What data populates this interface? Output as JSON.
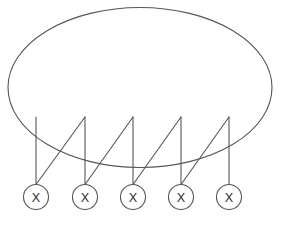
{
  "diagram": {
    "type": "bipartite-plate-graph",
    "stroke_color": "#555555",
    "label_color": "#444444",
    "plate": {
      "shape": "ellipse",
      "cx": 140,
      "cy": 87.5,
      "rx": 132,
      "ry": 80
    },
    "stem_top_y": 117,
    "nodes": [
      {
        "label": "X",
        "cx": 36,
        "cy": 197,
        "r": 12.5
      },
      {
        "label": "X",
        "cx": 85,
        "cy": 197,
        "r": 12.5
      },
      {
        "label": "X",
        "cx": 133,
        "cy": 197,
        "r": 12.5
      },
      {
        "label": "X",
        "cx": 181,
        "cy": 197,
        "r": 12.5
      },
      {
        "label": "X",
        "cx": 229,
        "cy": 197,
        "r": 12.5
      }
    ],
    "edges_description": "Each node has a vertical stem rising into the ellipse; each stem top (except the first) connects diagonally down to the previous node."
  }
}
